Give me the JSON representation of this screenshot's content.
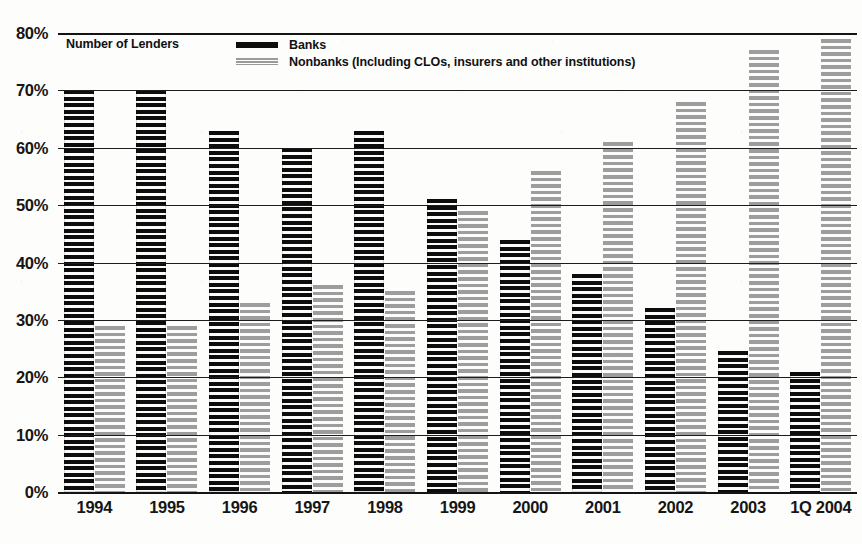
{
  "legend": {
    "caption": "Number of Lenders",
    "entries": [
      {
        "label": "Banks",
        "color": "#0d0d0d",
        "key": "banks"
      },
      {
        "label": "Nonbanks (Including CLOs, insurers and other institutions)",
        "color": "#9a9a9a",
        "key": "nonbanks"
      }
    ]
  },
  "chart_data": {
    "type": "bar",
    "title": "Number of Lenders",
    "xlabel": "",
    "ylabel": "",
    "ylim": [
      0,
      80
    ],
    "ytick_labels": [
      "80%",
      "70%",
      "60%",
      "50%",
      "40%",
      "30%",
      "20%",
      "10%",
      "0%"
    ],
    "ytick_values": [
      80,
      70,
      60,
      50,
      40,
      30,
      20,
      10,
      0
    ],
    "grid": true,
    "legend_position": "top-left",
    "unit": "%",
    "categories": [
      "1994",
      "1995",
      "1996",
      "1997",
      "1998",
      "1999",
      "2000",
      "2001",
      "2002",
      "2003",
      "1Q 2004"
    ],
    "series": [
      {
        "name": "Banks",
        "color": "#0d0d0d",
        "values": [
          70,
          70,
          63,
          60,
          63,
          51,
          44,
          38,
          32,
          24.5,
          21
        ]
      },
      {
        "name": "Nonbanks (Including CLOs, insurers and other institutions)",
        "color": "#9a9a9a",
        "values": [
          29,
          29,
          33,
          36,
          35,
          49,
          56,
          61,
          68,
          77,
          79
        ]
      }
    ]
  }
}
